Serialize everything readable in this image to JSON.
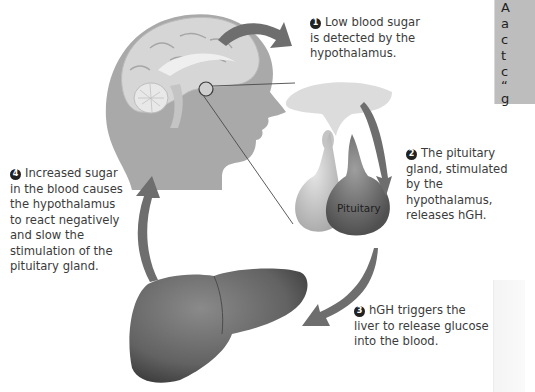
{
  "diagram": {
    "steps": [
      {
        "number": "1",
        "lines": [
          "Low blood sugar",
          "is detected by the",
          "hypothalamus."
        ]
      },
      {
        "number": "2",
        "lines": [
          "The pituitary",
          "gland, stimulated",
          "by the hypothalamus,",
          "releases hGH."
        ]
      },
      {
        "number": "3",
        "lines": [
          "hGH triggers the",
          "liver to release glucose",
          "into the blood."
        ]
      },
      {
        "number": "4",
        "lines": [
          "Increased sugar",
          "in the blood causes",
          "the hypothalamus",
          "to react negatively",
          "and slow the",
          "stimulation of the",
          "pituitary gland."
        ]
      }
    ],
    "labels": {
      "pituitary": "Pituitary"
    },
    "illustrations": [
      "head-with-brain",
      "pituitary-gland",
      "liver"
    ],
    "sidebox_fragment": [
      "A",
      "a",
      "c",
      "t",
      "c",
      "“",
      "g"
    ],
    "colors": {
      "arrow": "#6e6e6e",
      "head": "#a9a9a9",
      "brain": "#d6d6d6",
      "liver": "#6a6a6a",
      "sidebox": "#bdbdbd"
    }
  }
}
